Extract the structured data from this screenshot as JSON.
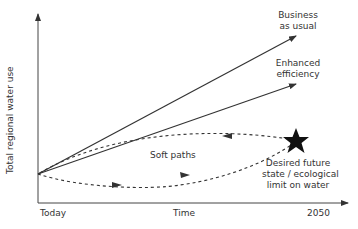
{
  "diagram": {
    "type": "conceptual line diagram",
    "y_axis_label": "Total regional water use",
    "x_axis": {
      "start_label": "Today",
      "middle_label": "Time",
      "end_label": "2050"
    },
    "paths": [
      {
        "name": "business-as-usual",
        "label_line1": "Business",
        "label_line2": "as usual",
        "style": "solid arrow"
      },
      {
        "name": "enhanced-efficiency",
        "label_line1": "Enhanced",
        "label_line2": "efficiency",
        "style": "solid arrow"
      },
      {
        "name": "soft-paths",
        "label": "Soft paths",
        "style": "dashed curves with arrows"
      }
    ],
    "target": {
      "label_line1": "Desired future",
      "label_line2": "state / ecological",
      "label_line3": "limit on water",
      "marker": "star-icon"
    }
  }
}
